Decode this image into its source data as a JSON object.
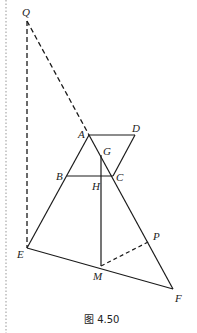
{
  "figure": {
    "caption": "图 4.50",
    "points": {
      "Q": {
        "label": "Q",
        "x": 27,
        "y": 21
      },
      "A": {
        "label": "A",
        "x": 89,
        "y": 135
      },
      "D": {
        "label": "D",
        "x": 135,
        "y": 135
      },
      "G": {
        "label": "G",
        "x": 101,
        "y": 155
      },
      "B": {
        "label": "B",
        "x": 67,
        "y": 176
      },
      "H": {
        "label": "H",
        "x": 101,
        "y": 176
      },
      "C": {
        "label": "C",
        "x": 113,
        "y": 176
      },
      "E": {
        "label": "E",
        "x": 27,
        "y": 248
      },
      "M": {
        "label": "M",
        "x": 101,
        "y": 266
      },
      "P": {
        "label": "P",
        "x": 150,
        "y": 241
      },
      "F": {
        "label": "F",
        "x": 173,
        "y": 289
      }
    },
    "solid_segments": [
      "AD",
      "DC",
      "AE",
      "AF",
      "BC",
      "GM",
      "EF"
    ],
    "dashed_segments": [
      "QA",
      "QE",
      "MP"
    ],
    "colors": {
      "line": "#1a1a1a",
      "label": "#222222",
      "border_dots": "#bbbbbb"
    }
  }
}
